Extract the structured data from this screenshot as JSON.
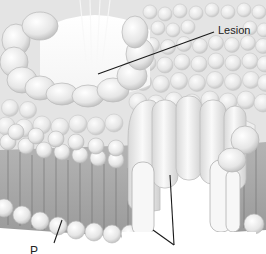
{
  "figure": {
    "palette": {
      "background": "#ffffff",
      "membrane_surface": "#e6e6e6",
      "head_fill": "#efefef",
      "head_stroke": "#bdbdbd",
      "tail_shadow": "#9e9e9e",
      "protein_fill": "#f3f3f3",
      "protein_stroke": "#bcbcbc",
      "leader_line": "#1a1a1a"
    }
  },
  "labels": {
    "lesion": "Lesion",
    "bottom_left_partial": "P"
  }
}
